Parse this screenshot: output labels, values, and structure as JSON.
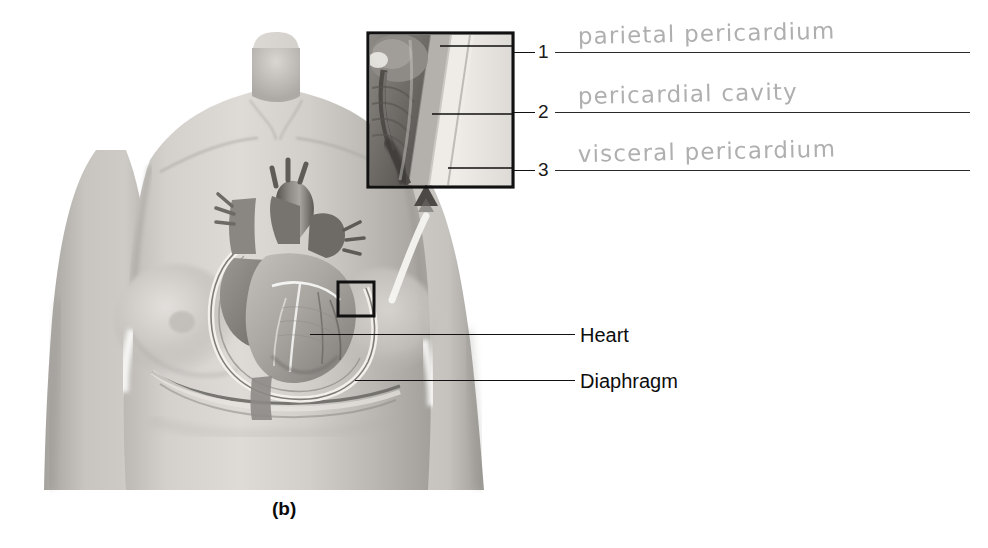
{
  "figure": {
    "caption": "(b)",
    "caption_x": 272,
    "caption_y": 498
  },
  "printed_labels": [
    {
      "name": "heart",
      "text": "Heart",
      "label_x": 580,
      "label_y": 325,
      "leader_x": 310,
      "leader_y": 334,
      "leader_width": 265
    },
    {
      "name": "diaphragm",
      "text": "Diaphragm",
      "label_x": 580,
      "label_y": 371,
      "leader_x": 355,
      "leader_y": 380,
      "leader_width": 220
    }
  ],
  "answer_rows": [
    {
      "number": "1",
      "answer": "parietal pericardium",
      "y": 52,
      "dash_x": 513,
      "dash_width": 22,
      "num_x": 538,
      "rule_x": 555,
      "rule_width": 415,
      "hand_x": 578
    },
    {
      "number": "2",
      "answer": "pericardial cavity",
      "y": 112,
      "dash_x": 513,
      "dash_width": 22,
      "num_x": 538,
      "rule_x": 555,
      "rule_width": 415,
      "hand_x": 578
    },
    {
      "number": "3",
      "answer": "visceral pericardium",
      "y": 170,
      "dash_x": 513,
      "dash_width": 22,
      "num_x": 538,
      "rule_x": 555,
      "rule_width": 415,
      "hand_x": 578
    }
  ],
  "inset": {
    "name": "pericardium-magnified-inset",
    "x": 368,
    "y": 33,
    "width": 145,
    "height": 154,
    "leader_targets": [
      {
        "to_number": "1",
        "from_x": 440,
        "from_y": 45
      },
      {
        "to_number": "2",
        "from_x": 432,
        "from_y": 113
      },
      {
        "to_number": "3",
        "from_x": 448,
        "from_y": 168
      }
    ]
  },
  "callout_box": {
    "name": "heart-wall-callout-box",
    "x": 338,
    "y": 282,
    "width": 36,
    "height": 34
  },
  "colors": {
    "background": "#ffffff",
    "skin_light": "#d8d6d2",
    "skin_mid": "#b9b6b1",
    "skin_shadow": "#97948f",
    "line_black": "#111111",
    "handwriting": "#a9a9a9",
    "tissue_dark": "#6e6b68",
    "tissue_mid": "#9a9792",
    "tissue_light": "#cfccc7"
  }
}
